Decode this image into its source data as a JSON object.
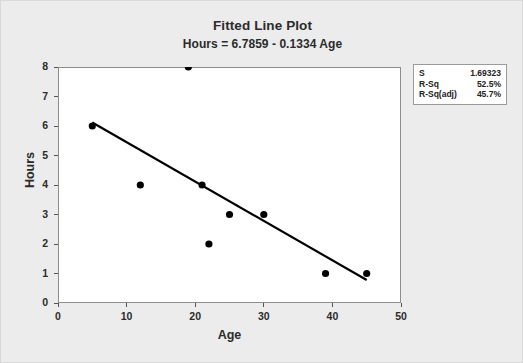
{
  "chart_data": {
    "type": "scatter",
    "title": "Fitted Line Plot",
    "subtitle": "Hours = 6.7859 - 0.1334 Age",
    "xlabel": "Age",
    "ylabel": "Hours",
    "xlim": [
      0,
      50
    ],
    "ylim": [
      0,
      8
    ],
    "xticks": [
      0,
      10,
      20,
      30,
      40,
      50
    ],
    "yticks": [
      0,
      1,
      2,
      3,
      4,
      5,
      6,
      7,
      8
    ],
    "grid": false,
    "legend": "none",
    "points": [
      {
        "x": 5,
        "y": 6
      },
      {
        "x": 12,
        "y": 4
      },
      {
        "x": 19,
        "y": 8
      },
      {
        "x": 21,
        "y": 4
      },
      {
        "x": 22,
        "y": 2
      },
      {
        "x": 25,
        "y": 3
      },
      {
        "x": 30,
        "y": 3
      },
      {
        "x": 39,
        "y": 1
      },
      {
        "x": 45,
        "y": 1
      }
    ],
    "fit_line": {
      "intercept": 6.7859,
      "slope": -0.1334,
      "x_start": 5,
      "x_end": 45,
      "y_start": 6.12,
      "y_end": 0.78
    },
    "marker_color": "#000000",
    "line_color": "#000000"
  },
  "stats": {
    "rows": [
      {
        "key": "S",
        "value": "1.69323"
      },
      {
        "key": "R-Sq",
        "value": "52.5%"
      },
      {
        "key": "R-Sq(adj)",
        "value": "45.7%"
      }
    ]
  }
}
